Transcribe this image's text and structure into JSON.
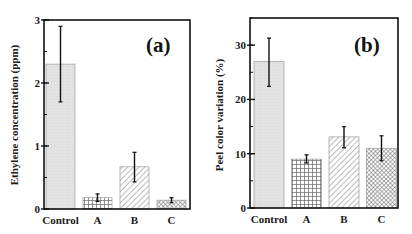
{
  "chart_data": [
    {
      "type": "bar",
      "panel_label": "(a)",
      "title": "",
      "xlabel": "",
      "ylabel": "Ethylene concentration (ppm)",
      "categories": [
        "Control",
        "A",
        "B",
        "C"
      ],
      "values": [
        2.3,
        0.18,
        0.67,
        0.14
      ],
      "error_low": [
        1.7,
        0.12,
        0.43,
        0.1
      ],
      "error_high": [
        2.9,
        0.24,
        0.9,
        0.18
      ],
      "patterns": [
        "fine-grid",
        "square-grid",
        "diagonal-hatch",
        "crosshatch"
      ],
      "ylim": [
        0,
        3
      ],
      "yticks": [
        0,
        1,
        2,
        3
      ],
      "ytick_labels": [
        "0",
        "1",
        "2",
        "3"
      ],
      "minor_ytick_step": 0.5,
      "grid": false,
      "legend": "none"
    },
    {
      "type": "bar",
      "panel_label": "(b)",
      "title": "",
      "xlabel": "",
      "ylabel": "Peel color variation (%)",
      "categories": [
        "Control",
        "A",
        "B",
        "C"
      ],
      "values": [
        27,
        9,
        13.1,
        11
      ],
      "error_low": [
        22.4,
        8.3,
        11.1,
        8.7
      ],
      "error_high": [
        31.3,
        9.8,
        15.0,
        13.3
      ],
      "patterns": [
        "fine-grid",
        "square-grid",
        "diagonal-hatch",
        "crosshatch"
      ],
      "ylim": [
        0,
        35
      ],
      "yticks": [
        0,
        10,
        20,
        30
      ],
      "ytick_labels": [
        "0",
        "10",
        "20",
        "30"
      ],
      "minor_ytick_step": 5,
      "grid": false,
      "legend": "none"
    }
  ],
  "colors": {
    "axis": "#111111",
    "bar_fill": "#e6e6e6",
    "bar_stroke": "#9a9a9a",
    "pattern": "#555555",
    "error_bar": "#111111"
  }
}
